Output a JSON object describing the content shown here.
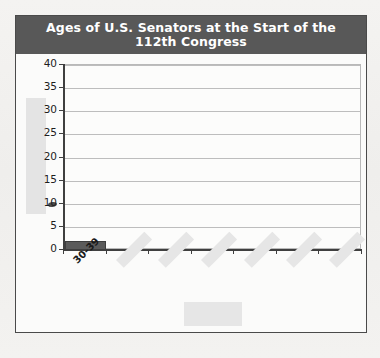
{
  "figure": {
    "title": "Ages of U.S. Senators at the Start of the 112th Congress",
    "title_line1": "Ages of U.S. Senators at the Start of the",
    "title_line2": "112th Congress",
    "banner_color": "#585858",
    "banner_text_color": "#ffffff",
    "frame_border_color": "#4a4a4a",
    "page_background": "#f2f1ef"
  },
  "annotations": {
    "ink_smudge_label": "ink-smudge-near-20",
    "y_axis_title_redacted_label": "redacted y-axis title",
    "x_axis_title_redacted_label": "redacted x-axis title",
    "redacted_color": "#e5e5e5"
  },
  "chart_data": {
    "type": "bar",
    "title": "Ages of U.S. Senators at the Start of the 112th Congress",
    "xlabel": "",
    "ylabel": "",
    "categories": [
      "30-39",
      "",
      "",
      "",
      "",
      "",
      ""
    ],
    "category_labels_visible": [
      "30-39"
    ],
    "category_labels_redacted": [
      "",
      "",
      "",
      "",
      "",
      ""
    ],
    "values": [
      2,
      null,
      null,
      null,
      null,
      null,
      null
    ],
    "ylim": [
      0,
      40
    ],
    "ytick_values": [
      0,
      5,
      10,
      15,
      20,
      25,
      30,
      35,
      40
    ],
    "ytick_labels": [
      "0",
      "5",
      "10",
      "15",
      "20",
      "25",
      "30",
      "35",
      "40"
    ],
    "grid": true,
    "grid_axis": "y",
    "legend": false,
    "bar_color": "#5b5b5b",
    "plot_background": "#fcfcfb"
  }
}
